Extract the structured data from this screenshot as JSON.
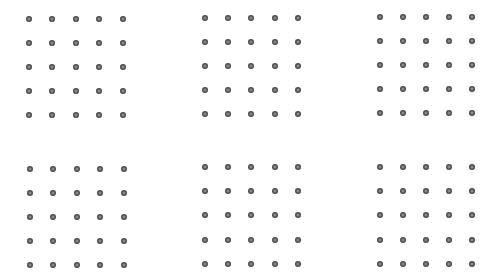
{
  "canvas": {
    "width": 500,
    "height": 280,
    "background": "#ffffff"
  },
  "dot_style": {
    "diameter": 6,
    "ring_color": "#4e4e4e",
    "center_color": "#8a8a8a"
  },
  "grids": [
    {
      "name": "grid-top-left",
      "cols": [
        29,
        52,
        76,
        99,
        123
      ],
      "rows": [
        19,
        43,
        67,
        91,
        115
      ]
    },
    {
      "name": "grid-top-center",
      "cols": [
        205,
        228,
        251,
        275,
        298
      ],
      "rows": [
        18,
        42,
        66,
        90,
        114
      ]
    },
    {
      "name": "grid-top-right",
      "cols": [
        380,
        403,
        426,
        449,
        472
      ],
      "rows": [
        17,
        41,
        65,
        89,
        113
      ]
    },
    {
      "name": "grid-bottom-left",
      "cols": [
        30,
        53,
        77,
        100,
        124
      ],
      "rows": [
        169,
        193,
        217,
        241,
        265
      ]
    },
    {
      "name": "grid-bottom-center",
      "cols": [
        205,
        228,
        251,
        275,
        298
      ],
      "rows": [
        167,
        191,
        215,
        240,
        264
      ]
    },
    {
      "name": "grid-bottom-right",
      "cols": [
        380,
        403,
        426,
        449,
        472
      ],
      "rows": [
        167,
        191,
        215,
        240,
        264
      ]
    }
  ]
}
